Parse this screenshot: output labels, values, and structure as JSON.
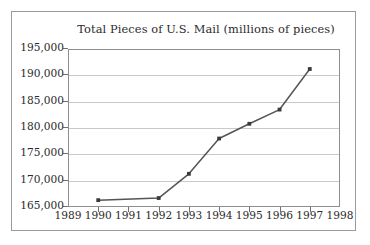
{
  "chart_data": {
    "type": "line",
    "title": "Total Pieces of U.S. Mail (millions of pieces)",
    "xlabel": "",
    "ylabel": "",
    "x": [
      1990,
      1992,
      1993,
      1994,
      1995,
      1996,
      1997
    ],
    "values": [
      166300,
      166700,
      171300,
      178000,
      180800,
      183500,
      191200
    ],
    "series": [
      {
        "name": "Total Pieces of U.S. Mail",
        "x": [
          1990,
          1992,
          1993,
          1994,
          1995,
          1996,
          1997
        ],
        "values": [
          166300,
          166700,
          171300,
          178000,
          180800,
          183500,
          191200
        ]
      }
    ],
    "xlim": [
      1989,
      1998
    ],
    "ylim": [
      165000,
      195000
    ],
    "xticks": [
      1989,
      1990,
      1991,
      1992,
      1993,
      1994,
      1995,
      1996,
      1997,
      1998
    ],
    "xtick_labels": [
      "1989",
      "1990",
      "1991",
      "1992",
      "1993",
      "1994",
      "1995",
      "1996",
      "1997",
      "1998"
    ],
    "yticks": [
      165000,
      170000,
      175000,
      180000,
      185000,
      190000,
      195000
    ],
    "ytick_labels": [
      "165,000",
      "170,000",
      "175,000",
      "180,000",
      "185,000",
      "190,000",
      "195,000"
    ],
    "grid": "horizontal",
    "legend": "none",
    "marker": "square",
    "line_color": "#555555",
    "marker_color": "#3a3a3a",
    "grid_color": "#c9c9c9",
    "axis_color": "#8e8e8e",
    "text_color": "#2b2b2b",
    "background_color": "#ffffff"
  }
}
